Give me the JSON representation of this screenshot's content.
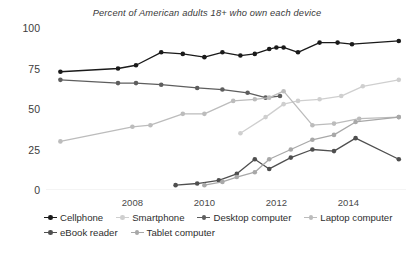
{
  "chart_data": {
    "type": "line",
    "title": "Percent of American adults 18+ who own each device",
    "xlabel": "",
    "ylabel": "",
    "xlim": [
      2005.6,
      2015.6
    ],
    "ylim": [
      0,
      100
    ],
    "xticks": [
      "2008",
      "2010",
      "2012",
      "2014"
    ],
    "xtick_values": [
      2008,
      2010,
      2012,
      2014
    ],
    "yticks": [
      "0",
      "25",
      "50",
      "75",
      "100"
    ],
    "ytick_values": [
      0,
      25,
      50,
      75,
      100
    ],
    "grid": false,
    "legend_position": "below",
    "series": [
      {
        "name": "Cellphone",
        "color": "#1a1a1a",
        "x": [
          2006.0,
          2007.6,
          2008.1,
          2008.8,
          2009.4,
          2010.0,
          2010.5,
          2011.0,
          2011.4,
          2011.8,
          2012.0,
          2012.2,
          2012.6,
          2013.2,
          2013.7,
          2014.1,
          2015.4
        ],
        "values": [
          73,
          75,
          77,
          85,
          84,
          82,
          85,
          83,
          84,
          87,
          88,
          88,
          85,
          91,
          91,
          90,
          92
        ]
      },
      {
        "name": "Smartphone",
        "color": "#cfcfcf",
        "x": [
          2011.0,
          2011.7,
          2012.2,
          2012.6,
          2013.2,
          2013.8,
          2014.4,
          2015.4
        ],
        "values": [
          35,
          45,
          53,
          55,
          56,
          58,
          64,
          68
        ]
      },
      {
        "name": "Desktop computer",
        "color": "#5e5e5e",
        "x": [
          2006.0,
          2007.6,
          2008.1,
          2008.8,
          2009.8,
          2010.5,
          2011.2,
          2011.7,
          2012.1
        ],
        "values": [
          68,
          66,
          66,
          65,
          63,
          62,
          60,
          57,
          58
        ]
      },
      {
        "name": "Laptop computer",
        "color": "#bcbcbc",
        "x": [
          2006.0,
          2008.0,
          2008.5,
          2009.4,
          2010.0,
          2010.8,
          2011.4,
          2011.8,
          2012.2,
          2013.0,
          2013.6,
          2014.3,
          2015.4
        ],
        "values": [
          30,
          39,
          40,
          47,
          47,
          55,
          56,
          57,
          61,
          40,
          41,
          44,
          45
        ]
      },
      {
        "name": "eBook reader",
        "color": "#4f4f4f",
        "x": [
          2009.2,
          2009.8,
          2010.4,
          2010.9,
          2011.4,
          2011.8,
          2012.4,
          2013.0,
          2013.6,
          2014.2,
          2015.4
        ],
        "values": [
          3,
          4,
          6,
          10,
          19,
          13,
          20,
          25,
          24,
          32,
          19
        ]
      },
      {
        "name": "Tablet computer",
        "color": "#a8a8a8",
        "x": [
          2010.0,
          2010.5,
          2010.9,
          2011.4,
          2011.8,
          2012.4,
          2013.0,
          2013.6,
          2014.2,
          2015.4
        ],
        "values": [
          3,
          5,
          8,
          11,
          19,
          25,
          31,
          34,
          42,
          45
        ]
      }
    ]
  },
  "legend": {
    "rows": [
      [
        {
          "label": "Cellphone",
          "color": "#1a1a1a"
        },
        {
          "label": "Smartphone",
          "color": "#cfcfcf"
        },
        {
          "label": "Desktop computer",
          "color": "#5e5e5e"
        },
        {
          "label": "Laptop computer",
          "color": "#bcbcbc"
        }
      ],
      [
        {
          "label": "eBook reader",
          "color": "#4f4f4f"
        },
        {
          "label": "Tablet computer",
          "color": "#a8a8a8"
        }
      ]
    ]
  }
}
